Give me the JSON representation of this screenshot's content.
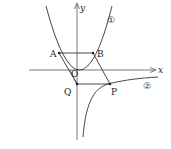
{
  "diagram": {
    "title": "",
    "axes": {
      "x_label": "x",
      "y_label": "y",
      "origin_label": "O"
    },
    "curves": [
      {
        "id": "1",
        "label": "①",
        "type": "parabola"
      },
      {
        "id": "2",
        "label": "②",
        "type": "hyperbola"
      }
    ],
    "points": [
      {
        "name": "A",
        "label": "A"
      },
      {
        "name": "B",
        "label": "B"
      },
      {
        "name": "Q",
        "label": "Q"
      },
      {
        "name": "P",
        "label": "P"
      }
    ],
    "colors": {
      "stroke": "#333333",
      "background": "#ffffff"
    }
  }
}
